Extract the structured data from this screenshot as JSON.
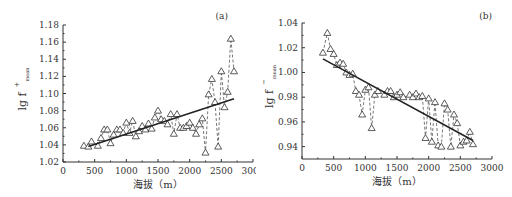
{
  "chart_data": [
    {
      "type": "line",
      "panel_label": "(a)",
      "title": "",
      "xlabel": "海拔（m）",
      "ylabel": "lg f",
      "ylabel_sup": "+",
      "ylabel_sub": "mean",
      "xlim": [
        0,
        3000
      ],
      "ylim": [
        1.02,
        1.18
      ],
      "xticks": [
        0,
        500,
        1000,
        1500,
        2000,
        2500,
        3000
      ],
      "xtick_labels": [
        "0",
        "500",
        "1000",
        "1500",
        "2000",
        "2500",
        "3000"
      ],
      "yticks": [
        1.02,
        1.04,
        1.06,
        1.08,
        1.1,
        1.12,
        1.14,
        1.16,
        1.18
      ],
      "ytick_labels": [
        "1.02",
        "1.04",
        "1.06",
        "1.08",
        "1.10",
        "1.12",
        "1.14",
        "1.16",
        "1.18"
      ],
      "grid": false,
      "series": [
        {
          "name": "observed",
          "style": "dashed line with open triangle markers",
          "x": [
            330,
            400,
            450,
            550,
            600,
            650,
            700,
            750,
            800,
            850,
            900,
            950,
            1000,
            1050,
            1100,
            1150,
            1200,
            1250,
            1300,
            1350,
            1400,
            1450,
            1500,
            1550,
            1600,
            1650,
            1700,
            1750,
            1800,
            1850,
            1900,
            1950,
            2000,
            2050,
            2100,
            2150,
            2200,
            2250,
            2300,
            2350,
            2400,
            2450,
            2500,
            2550,
            2600,
            2650,
            2700
          ],
          "values": [
            1.039,
            1.038,
            1.044,
            1.039,
            1.048,
            1.058,
            1.058,
            1.042,
            1.052,
            1.058,
            1.058,
            1.054,
            1.066,
            1.054,
            1.068,
            1.05,
            1.056,
            1.062,
            1.058,
            1.065,
            1.059,
            1.072,
            1.08,
            1.07,
            1.068,
            1.064,
            1.076,
            1.053,
            1.076,
            1.06,
            1.06,
            1.062,
            1.066,
            1.06,
            1.053,
            1.064,
            1.071,
            1.031,
            1.099,
            1.117,
            1.09,
            1.038,
            1.126,
            1.084,
            1.102,
            1.164,
            1.126
          ]
        },
        {
          "name": "linear fit",
          "style": "solid line",
          "x": [
            400,
            2700
          ],
          "values": [
            1.038,
            1.094
          ]
        }
      ]
    },
    {
      "type": "line",
      "panel_label": "(b)",
      "title": "",
      "xlabel": "海拔（m）",
      "ylabel": "lg f",
      "ylabel_sup": "−",
      "ylabel_sub": "mean",
      "xlim": [
        0,
        3000
      ],
      "ylim": [
        0.93,
        1.04
      ],
      "xticks": [
        0,
        500,
        1000,
        1500,
        2000,
        2500,
        3000
      ],
      "xtick_labels": [
        "0",
        "500",
        "1000",
        "1500",
        "2000",
        "2500",
        "3000"
      ],
      "yticks": [
        0.94,
        0.96,
        0.98,
        1.0,
        1.02,
        1.04
      ],
      "ytick_labels": [
        "0.94",
        "0.96",
        "0.98",
        "1.00",
        "1.02",
        "1.04"
      ],
      "grid": false,
      "series": [
        {
          "name": "observed",
          "style": "dashed line with open triangle markers",
          "x": [
            330,
            400,
            450,
            500,
            550,
            600,
            650,
            700,
            750,
            800,
            850,
            900,
            950,
            1000,
            1050,
            1100,
            1150,
            1200,
            1300,
            1350,
            1400,
            1450,
            1500,
            1550,
            1600,
            1700,
            1750,
            1800,
            1850,
            1900,
            1950,
            2000,
            2050,
            2100,
            2150,
            2200,
            2250,
            2300,
            2350,
            2400,
            2450,
            2500,
            2550,
            2600,
            2650,
            2700
          ],
          "values": [
            1.016,
            1.032,
            1.019,
            1.015,
            1.006,
            1.008,
            1.007,
            1.0,
            0.998,
            0.999,
            0.985,
            0.982,
            0.966,
            0.986,
            0.988,
            0.955,
            0.982,
            0.985,
            0.982,
            0.985,
            0.985,
            0.98,
            0.982,
            0.984,
            0.98,
            0.982,
            0.98,
            0.983,
            0.98,
            0.981,
            0.947,
            0.979,
            0.944,
            0.976,
            0.941,
            0.94,
            0.975,
            0.97,
            0.94,
            0.966,
            0.959,
            0.941,
            0.944,
            0.945,
            0.952,
            0.942
          ]
        },
        {
          "name": "linear fit",
          "style": "solid line",
          "x": [
            330,
            2700
          ],
          "values": [
            1.011,
            0.945
          ]
        }
      ]
    }
  ]
}
